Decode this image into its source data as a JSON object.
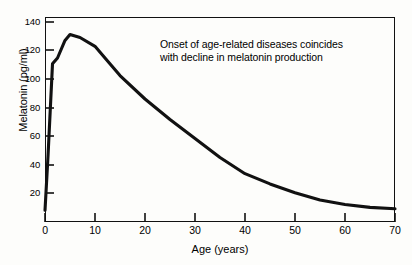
{
  "chart_data": {
    "type": "line",
    "title": "",
    "xlabel": "Age (years)",
    "ylabel": "Melatonin (pg/ml)",
    "xlim": [
      0,
      70
    ],
    "ylim": [
      0,
      140
    ],
    "xticks": [
      0,
      10,
      20,
      30,
      40,
      50,
      60,
      70
    ],
    "yticks": [
      20,
      40,
      60,
      80,
      100,
      120,
      140
    ],
    "grid": false,
    "legend": null,
    "line_color": "#111111",
    "series": [
      {
        "name": "Melatonin",
        "x": [
          0,
          0.6,
          1.5,
          2.5,
          4,
          5,
          7,
          10,
          12,
          15,
          20,
          25,
          30,
          35,
          40,
          45,
          50,
          55,
          60,
          65,
          70
        ],
        "values": [
          8,
          45,
          108,
          112,
          124,
          128,
          126,
          120,
          112,
          100,
          84,
          70,
          57,
          44,
          33,
          26,
          20,
          15,
          12,
          10,
          9
        ]
      }
    ],
    "annotations": [
      {
        "lines": [
          "Onset of age-related diseases coincides",
          "with decline in melatonin production"
        ]
      }
    ]
  },
  "axes": {
    "y_ticks_labels": [
      "140",
      "120",
      "100",
      "80",
      "60",
      "40",
      "20"
    ],
    "x_ticks_labels": [
      "0",
      "10",
      "20",
      "30",
      "40",
      "50",
      "60",
      "70"
    ]
  }
}
